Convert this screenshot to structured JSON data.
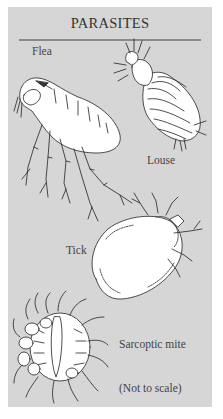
{
  "title": "PARASITES",
  "labels": {
    "flea": "Flea",
    "louse": "Louse",
    "tick": "Tick",
    "sarcoptic_mite": "Sarcoptic mite",
    "note": "(Not to scale)"
  },
  "colors": {
    "panel_background": "#d6d6d6",
    "rule": "#8a8a8a",
    "text": "#444444",
    "illustration_fill": "#ffffff",
    "illustration_stroke": "#222222"
  }
}
